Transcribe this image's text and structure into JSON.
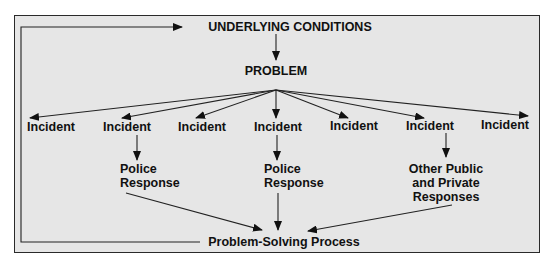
{
  "diagram": {
    "type": "flow",
    "top_node": "UNDERLYING CONDITIONS",
    "problem_node": "PROBLEM",
    "incidents": [
      "Incident",
      "Incident",
      "Incident",
      "Incident",
      "Incident",
      "Incident",
      "Incident"
    ],
    "responses": [
      {
        "from_incident": 2,
        "line1": "Police",
        "line2": "Response"
      },
      {
        "from_incident": 4,
        "line1": "Police",
        "line2": "Response"
      },
      {
        "from_incident": 6,
        "line1": "Other Public",
        "line2": "and Private",
        "line3": "Responses"
      }
    ],
    "process_node": "Problem-Solving Process",
    "feedback": "Problem-Solving Process feeds back to UNDERLYING CONDITIONS"
  },
  "colors": {
    "frame_bg": "#e6e6e6",
    "frame_border": "#2a2a2a",
    "ink": "#111111"
  }
}
